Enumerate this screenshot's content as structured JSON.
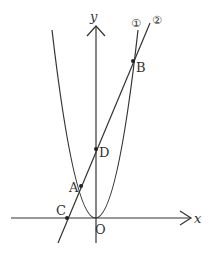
{
  "diagram": {
    "axes": {
      "x_label": "x",
      "y_label": "y",
      "origin_label": "O"
    },
    "curves": [
      {
        "id": "1",
        "label": "①",
        "type": "parabola"
      },
      {
        "id": "2",
        "label": "②",
        "type": "line"
      }
    ],
    "points": [
      {
        "name": "A"
      },
      {
        "name": "B"
      },
      {
        "name": "C"
      },
      {
        "name": "D"
      }
    ],
    "colors": {
      "stroke": "#333333",
      "background": "#ffffff"
    }
  }
}
